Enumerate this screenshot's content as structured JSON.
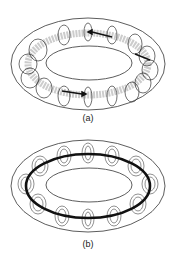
{
  "panels": [
    {
      "id": "a",
      "label": "(a)",
      "description": "torus with poloidal field loops and toroidal flow arrows"
    },
    {
      "id": "b",
      "label": "(b)",
      "description": "torus with concentric poloidal loops and bold toroidal current ring"
    }
  ],
  "colors": {
    "line": "#333333",
    "shading": "#9a9a9a",
    "background": "#ffffff"
  }
}
